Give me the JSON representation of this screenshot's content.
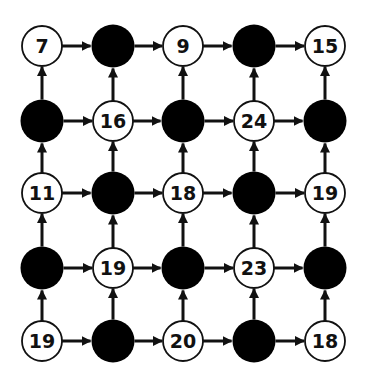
{
  "diagram": {
    "type": "grid-graph",
    "rows": 5,
    "cols": 5,
    "edge_direction": "right-and-up",
    "colors": {
      "filled": "#000000",
      "empty_fill": "#ffffff",
      "stroke": "#111111"
    },
    "nodes": [
      [
        {
          "filled": false,
          "label": "7"
        },
        {
          "filled": true,
          "label": ""
        },
        {
          "filled": false,
          "label": "9"
        },
        {
          "filled": true,
          "label": ""
        },
        {
          "filled": false,
          "label": "15"
        }
      ],
      [
        {
          "filled": true,
          "label": ""
        },
        {
          "filled": false,
          "label": "16"
        },
        {
          "filled": true,
          "label": ""
        },
        {
          "filled": false,
          "label": "24"
        },
        {
          "filled": true,
          "label": ""
        }
      ],
      [
        {
          "filled": false,
          "label": "11"
        },
        {
          "filled": true,
          "label": ""
        },
        {
          "filled": false,
          "label": "18"
        },
        {
          "filled": true,
          "label": ""
        },
        {
          "filled": false,
          "label": "19"
        }
      ],
      [
        {
          "filled": true,
          "label": ""
        },
        {
          "filled": false,
          "label": "19"
        },
        {
          "filled": true,
          "label": ""
        },
        {
          "filled": false,
          "label": "23"
        },
        {
          "filled": true,
          "label": ""
        }
      ],
      [
        {
          "filled": false,
          "label": "19"
        },
        {
          "filled": true,
          "label": ""
        },
        {
          "filled": false,
          "label": "20"
        },
        {
          "filled": true,
          "label": ""
        },
        {
          "filled": false,
          "label": "18"
        }
      ]
    ]
  }
}
